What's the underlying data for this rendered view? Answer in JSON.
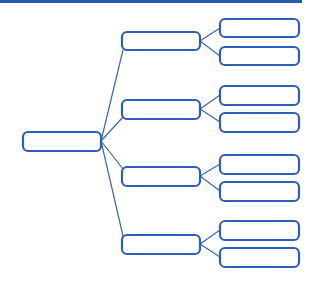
{
  "diagram": {
    "type": "tree",
    "colors": {
      "stroke": "#2f5fb3",
      "line": "#3a66b0",
      "topbar": "#2a5aa8",
      "fill": "#ffffff"
    },
    "root": {
      "label": ""
    },
    "branches": [
      {
        "label": "",
        "children": [
          {
            "label": ""
          },
          {
            "label": ""
          }
        ]
      },
      {
        "label": "",
        "children": [
          {
            "label": ""
          },
          {
            "label": ""
          }
        ]
      },
      {
        "label": "",
        "children": [
          {
            "label": ""
          },
          {
            "label": ""
          }
        ]
      },
      {
        "label": "",
        "children": [
          {
            "label": ""
          },
          {
            "label": ""
          }
        ]
      }
    ]
  }
}
